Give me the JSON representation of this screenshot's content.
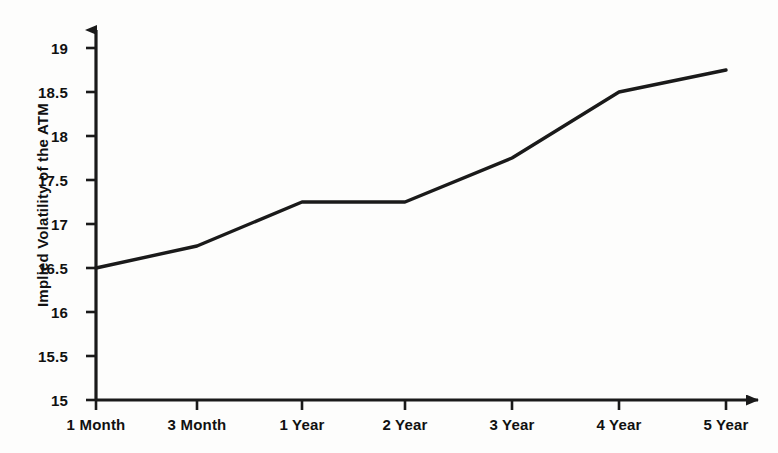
{
  "chart_data": {
    "type": "line",
    "title": "",
    "xlabel": "",
    "ylabel": "Implied Volatility of the ATM",
    "categories": [
      "1 Month",
      "3 Month",
      "1 Year",
      "2 Year",
      "3 Year",
      "4 Year",
      "5 Year"
    ],
    "values": [
      16.5,
      16.75,
      17.25,
      17.25,
      17.75,
      18.5,
      18.75
    ],
    "series": [
      {
        "name": "Implied Volatility of the ATM",
        "values": [
          16.5,
          16.75,
          17.25,
          17.25,
          17.75,
          18.5,
          18.75
        ]
      }
    ],
    "ylim": [
      15,
      19
    ],
    "y_ticks": [
      15,
      15.5,
      16,
      16.5,
      17,
      17.5,
      18,
      18.5,
      19
    ],
    "y_tick_labels": [
      "15",
      "15.5",
      "16",
      "16.5",
      "17",
      "17.5",
      "18",
      "18.5",
      "19"
    ],
    "x_tick_labels": [
      "1 Month",
      "3 Month",
      "1 Year",
      "2 Year",
      "3 Year",
      "4 Year",
      "5 Year"
    ],
    "grid": false,
    "legend": false,
    "legend_position": "none",
    "line_color": "#1a1a1a",
    "axis_color": "#1a1a1a",
    "background_color": "#fdfdfc",
    "annotations": []
  },
  "axes": {
    "y_arrow": "up-arrow-icon",
    "x_arrow": "right-arrow-icon"
  }
}
